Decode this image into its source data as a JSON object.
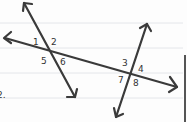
{
  "diagram": {
    "problem_number": "2.",
    "angle_labels": {
      "a1": "1",
      "a2": "2",
      "a5": "5",
      "a6": "6",
      "a3": "3",
      "a4": "4",
      "a7": "7",
      "a8": "8"
    },
    "colors": {
      "ink": "#3a3a3a",
      "rule": "#e4e6ea",
      "paper": "#fdfdfd",
      "edge": "#555555"
    }
  }
}
